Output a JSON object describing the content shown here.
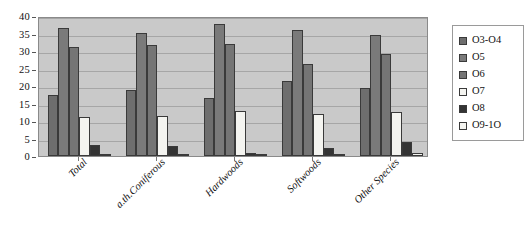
{
  "chart_data": {
    "type": "bar",
    "title": "",
    "subtitle": "",
    "xlabel": "",
    "ylabel": "",
    "categories": [
      "Total",
      "a.th.Coniferous",
      "Hardwoods",
      "Softwoods",
      "Other Species"
    ],
    "series": [
      {
        "name": "O3-O4",
        "color": "#6e6e6e",
        "values": [
          17.5,
          18.8,
          16.6,
          21.4,
          19.4
        ]
      },
      {
        "name": "O5",
        "color": "#7a7a7a",
        "values": [
          36.6,
          35.1,
          37.6,
          36.0,
          34.6
        ]
      },
      {
        "name": "O6",
        "color": "#757575",
        "values": [
          31.2,
          31.7,
          32.0,
          26.4,
          29.1
        ]
      },
      {
        "name": "O7",
        "color": "#f4f4f0",
        "values": [
          11.2,
          11.5,
          13.0,
          12.0,
          12.6
        ]
      },
      {
        "name": "O8",
        "color": "#343434",
        "values": [
          3.1,
          2.8,
          1.0,
          2.4,
          4.0
        ]
      },
      {
        "name": "O9-1O",
        "color": "#f4f4f0",
        "values": [
          0.4,
          0.5,
          0.3,
          0.5,
          1.0
        ]
      }
    ],
    "ylim": [
      0,
      40
    ],
    "yticks": [
      0,
      5,
      10,
      15,
      20,
      25,
      30,
      35,
      40
    ],
    "ytick_labels": [
      "0",
      "5",
      "10",
      "15",
      "20",
      "25",
      "30",
      "35",
      "40"
    ],
    "grid": true,
    "legend_position": "right",
    "plot_background": "#c9c9c9",
    "figure_background": "#ffffff"
  },
  "legend": {
    "items": [
      {
        "label": "O3-O4"
      },
      {
        "label": "O5"
      },
      {
        "label": "O6"
      },
      {
        "label": "O7"
      },
      {
        "label": "O8"
      },
      {
        "label": "O9-1O"
      }
    ]
  }
}
